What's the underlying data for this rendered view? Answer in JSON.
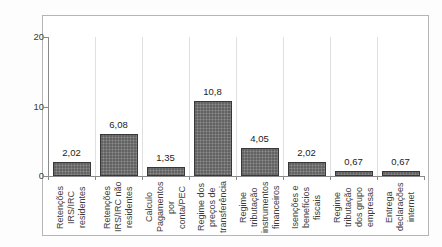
{
  "chart_data": {
    "type": "bar",
    "title": "",
    "categories": [
      "Retenções\nIRS/IRC\nresidentes",
      "Retenções\nIRS/IRC não\nresidentes",
      "Calculo\nPagamentos\npor conta/PEC",
      "Regime dos\npreços de\ntransferência",
      "Regime\ntributação\ninstrumentos\nfinanceiros",
      "Isenções e\nbenefícios\nfiscais",
      "Regime\ntributação\ndos grupo\nempresas",
      "Entrega\ndeclarações\ninternet"
    ],
    "values": [
      2.02,
      6.08,
      1.35,
      10.8,
      4.05,
      2.02,
      0.67,
      0.67
    ],
    "value_labels": [
      "2,02",
      "6,08",
      "1,35",
      "10,8",
      "4,05",
      "2,02",
      "0,67",
      "0,67"
    ],
    "xlabel": "",
    "ylabel": "",
    "ylim": [
      0,
      20
    ],
    "y_ticks": [
      0,
      10,
      20
    ],
    "y_tick_labels": [
      "0",
      "10",
      "20"
    ],
    "grid": "vertical category separators",
    "legend": "none",
    "colors": {
      "bar_fill": "#767676",
      "bar_border": "#383838",
      "frame_border": "#b5b5b5",
      "gridline": "#e0e0e0",
      "axis": "#8a8a8a",
      "text": "#3c3c3c",
      "background": "#ffffff"
    }
  }
}
